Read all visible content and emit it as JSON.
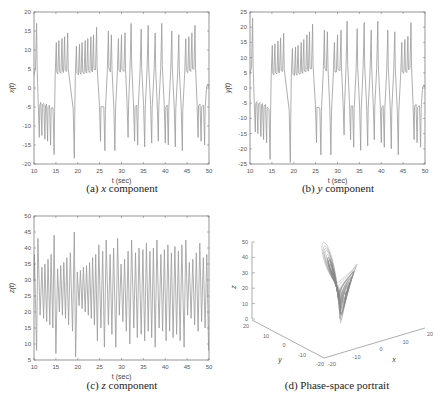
{
  "chart_data": [
    {
      "id": "a",
      "type": "line",
      "caption": "(a) x component",
      "caption_prefix": "(a)",
      "caption_var": "x",
      "caption_suffix": "component",
      "xlabel": "t (sec)",
      "ylabel": "x(t)",
      "xlim": [
        10,
        50
      ],
      "ylim": [
        -20,
        20
      ],
      "xticks": [
        10,
        15,
        20,
        25,
        30,
        35,
        40,
        45,
        50
      ],
      "yticks": [
        -20,
        -15,
        -10,
        -5,
        0,
        5,
        10,
        15,
        20
      ],
      "grid": false,
      "color": "#9a9a9a",
      "peaks": [
        {
          "t": 10.6,
          "v": 17
        },
        {
          "t": 11.2,
          "v": -13
        },
        {
          "t": 11.8,
          "v": -12.5
        },
        {
          "t": 12.5,
          "v": -13.5
        },
        {
          "t": 13.1,
          "v": -14
        },
        {
          "t": 13.8,
          "v": -15
        },
        {
          "t": 14.6,
          "v": -17.5
        },
        {
          "t": 15.1,
          "v": 12
        },
        {
          "t": 15.7,
          "v": 12.5
        },
        {
          "t": 16.4,
          "v": 13
        },
        {
          "t": 17.0,
          "v": 13.5
        },
        {
          "t": 17.7,
          "v": 14.5
        },
        {
          "t": 19.2,
          "v": -18.5
        },
        {
          "t": 19.7,
          "v": 11
        },
        {
          "t": 20.4,
          "v": 11.5
        },
        {
          "t": 21.0,
          "v": 12
        },
        {
          "t": 21.7,
          "v": 12.5
        },
        {
          "t": 22.3,
          "v": 13
        },
        {
          "t": 23.0,
          "v": 13.5
        },
        {
          "t": 23.6,
          "v": 14
        },
        {
          "t": 24.3,
          "v": 16
        },
        {
          "t": 25.2,
          "v": -14
        },
        {
          "t": 26.2,
          "v": -16.5
        },
        {
          "t": 27.0,
          "v": 15
        },
        {
          "t": 27.7,
          "v": 14
        },
        {
          "t": 28.5,
          "v": -16.5
        },
        {
          "t": 29.3,
          "v": 13
        },
        {
          "t": 30.0,
          "v": 14
        },
        {
          "t": 30.8,
          "v": 14.5
        },
        {
          "t": 31.5,
          "v": -13
        },
        {
          "t": 32.2,
          "v": 17
        },
        {
          "t": 33.0,
          "v": -14
        },
        {
          "t": 33.7,
          "v": -15
        },
        {
          "t": 34.5,
          "v": 15.5
        },
        {
          "t": 35.3,
          "v": -15.5
        },
        {
          "t": 36.1,
          "v": 16.5
        },
        {
          "t": 36.9,
          "v": -14.5
        },
        {
          "t": 37.7,
          "v": 14.5
        },
        {
          "t": 38.4,
          "v": -14
        },
        {
          "t": 39.2,
          "v": 17
        },
        {
          "t": 40.0,
          "v": -14.5
        },
        {
          "t": 40.7,
          "v": -15
        },
        {
          "t": 41.5,
          "v": 15
        },
        {
          "t": 42.3,
          "v": -15.5
        },
        {
          "t": 43.1,
          "v": 14
        },
        {
          "t": 43.9,
          "v": -16.5
        },
        {
          "t": 44.7,
          "v": 13
        },
        {
          "t": 45.4,
          "v": 13.5
        },
        {
          "t": 46.1,
          "v": 14.5
        },
        {
          "t": 46.8,
          "v": 16.5
        },
        {
          "t": 47.5,
          "v": -13
        },
        {
          "t": 48.2,
          "v": -14
        },
        {
          "t": 49.0,
          "v": -15
        },
        {
          "t": 49.7,
          "v": 1
        }
      ]
    },
    {
      "id": "b",
      "type": "line",
      "caption": "(b) y component",
      "caption_prefix": "(b)",
      "caption_var": "y",
      "caption_suffix": "component",
      "xlabel": "t (sec)",
      "ylabel": "y(t)",
      "xlim": [
        10,
        50
      ],
      "ylim": [
        -25,
        25
      ],
      "xticks": [
        10,
        15,
        20,
        25,
        30,
        35,
        40,
        45,
        50
      ],
      "yticks": [
        -25,
        -20,
        -15,
        -10,
        -5,
        0,
        5,
        10,
        15,
        20,
        25
      ],
      "grid": false,
      "color": "#9a9a9a",
      "peaks": [
        {
          "t": 10.6,
          "v": 23
        },
        {
          "t": 11.2,
          "v": -14.5
        },
        {
          "t": 11.8,
          "v": -15
        },
        {
          "t": 12.5,
          "v": -16
        },
        {
          "t": 13.1,
          "v": -17
        },
        {
          "t": 13.8,
          "v": -18
        },
        {
          "t": 14.6,
          "v": -23.5
        },
        {
          "t": 15.1,
          "v": 14
        },
        {
          "t": 15.7,
          "v": 14.5
        },
        {
          "t": 16.4,
          "v": 15.5
        },
        {
          "t": 17.0,
          "v": 16.5
        },
        {
          "t": 17.7,
          "v": 18
        },
        {
          "t": 19.2,
          "v": -24.5
        },
        {
          "t": 19.7,
          "v": 13
        },
        {
          "t": 20.4,
          "v": 13.5
        },
        {
          "t": 21.0,
          "v": 14
        },
        {
          "t": 21.7,
          "v": 15
        },
        {
          "t": 22.3,
          "v": 16
        },
        {
          "t": 23.0,
          "v": 17.5
        },
        {
          "t": 23.6,
          "v": 18.5
        },
        {
          "t": 24.3,
          "v": 21
        },
        {
          "t": 25.2,
          "v": -18
        },
        {
          "t": 26.2,
          "v": -22
        },
        {
          "t": 27.0,
          "v": 19
        },
        {
          "t": 27.7,
          "v": 18.5
        },
        {
          "t": 28.5,
          "v": -22
        },
        {
          "t": 29.3,
          "v": 15
        },
        {
          "t": 30.0,
          "v": 17.5
        },
        {
          "t": 30.8,
          "v": 19
        },
        {
          "t": 31.5,
          "v": -15.5
        },
        {
          "t": 32.2,
          "v": 22
        },
        {
          "t": 33.0,
          "v": -17
        },
        {
          "t": 33.7,
          "v": -19.5
        },
        {
          "t": 34.5,
          "v": 19.5
        },
        {
          "t": 35.3,
          "v": -20.5
        },
        {
          "t": 36.1,
          "v": 21.5
        },
        {
          "t": 36.9,
          "v": -19
        },
        {
          "t": 37.7,
          "v": 19
        },
        {
          "t": 38.4,
          "v": -17
        },
        {
          "t": 39.2,
          "v": 22
        },
        {
          "t": 40.0,
          "v": -18
        },
        {
          "t": 40.7,
          "v": -19.5
        },
        {
          "t": 41.5,
          "v": 19
        },
        {
          "t": 42.3,
          "v": -20
        },
        {
          "t": 43.1,
          "v": 18.5
        },
        {
          "t": 43.9,
          "v": -22
        },
        {
          "t": 44.7,
          "v": 15
        },
        {
          "t": 45.4,
          "v": 16
        },
        {
          "t": 46.1,
          "v": 17
        },
        {
          "t": 46.8,
          "v": 21.5
        },
        {
          "t": 47.5,
          "v": -17
        },
        {
          "t": 48.2,
          "v": -18
        },
        {
          "t": 49.0,
          "v": -19.5
        },
        {
          "t": 49.7,
          "v": 1
        }
      ]
    },
    {
      "id": "c",
      "type": "line",
      "caption": "(c) z component",
      "caption_prefix": "(c)",
      "caption_var": "z",
      "caption_suffix": "component",
      "xlabel": "t (sec)",
      "ylabel": "z(t)",
      "xlim": [
        10,
        50
      ],
      "ylim": [
        5,
        50
      ],
      "xticks": [
        10,
        15,
        20,
        25,
        30,
        35,
        40,
        45,
        50
      ],
      "yticks": [
        5,
        10,
        15,
        20,
        25,
        30,
        35,
        40,
        45,
        50
      ],
      "grid": false,
      "color": "#9a9a9a",
      "peaks": [
        {
          "t": 10.1,
          "v": 38
        },
        {
          "t": 10.6,
          "v": 8
        },
        {
          "t": 10.9,
          "v": 43
        },
        {
          "t": 11.4,
          "v": 19
        },
        {
          "t": 11.8,
          "v": 34
        },
        {
          "t": 12.2,
          "v": 18
        },
        {
          "t": 12.5,
          "v": 35
        },
        {
          "t": 12.9,
          "v": 17
        },
        {
          "t": 13.2,
          "v": 36.5
        },
        {
          "t": 13.6,
          "v": 16
        },
        {
          "t": 13.9,
          "v": 38
        },
        {
          "t": 14.3,
          "v": 15
        },
        {
          "t": 14.6,
          "v": 44
        },
        {
          "t": 15.0,
          "v": 7
        },
        {
          "t": 15.4,
          "v": 33.5
        },
        {
          "t": 15.8,
          "v": 20
        },
        {
          "t": 16.1,
          "v": 34.5
        },
        {
          "t": 16.5,
          "v": 19
        },
        {
          "t": 16.8,
          "v": 35.5
        },
        {
          "t": 17.2,
          "v": 18
        },
        {
          "t": 17.5,
          "v": 37
        },
        {
          "t": 17.9,
          "v": 16
        },
        {
          "t": 18.3,
          "v": 38.5
        },
        {
          "t": 18.8,
          "v": 14
        },
        {
          "t": 19.2,
          "v": 45
        },
        {
          "t": 19.5,
          "v": 6
        },
        {
          "t": 19.9,
          "v": 32.5
        },
        {
          "t": 20.3,
          "v": 22
        },
        {
          "t": 20.6,
          "v": 33
        },
        {
          "t": 21.0,
          "v": 21
        },
        {
          "t": 21.3,
          "v": 34
        },
        {
          "t": 21.7,
          "v": 20
        },
        {
          "t": 22.0,
          "v": 34.5
        },
        {
          "t": 22.4,
          "v": 19
        },
        {
          "t": 22.7,
          "v": 35.5
        },
        {
          "t": 23.1,
          "v": 18
        },
        {
          "t": 23.4,
          "v": 37
        },
        {
          "t": 23.8,
          "v": 16
        },
        {
          "t": 24.1,
          "v": 38
        },
        {
          "t": 24.5,
          "v": 11
        },
        {
          "t": 24.8,
          "v": 41
        },
        {
          "t": 25.3,
          "v": 15
        },
        {
          "t": 25.7,
          "v": 39
        },
        {
          "t": 26.1,
          "v": 9
        },
        {
          "t": 26.5,
          "v": 42.5
        },
        {
          "t": 27.0,
          "v": 16
        },
        {
          "t": 27.4,
          "v": 38
        },
        {
          "t": 27.8,
          "v": 13
        },
        {
          "t": 28.2,
          "v": 40
        },
        {
          "t": 28.7,
          "v": 9
        },
        {
          "t": 29.1,
          "v": 43
        },
        {
          "t": 29.5,
          "v": 19
        },
        {
          "t": 29.9,
          "v": 35
        },
        {
          "t": 30.3,
          "v": 17
        },
        {
          "t": 30.7,
          "v": 36.5
        },
        {
          "t": 31.1,
          "v": 14
        },
        {
          "t": 31.5,
          "v": 39
        },
        {
          "t": 31.9,
          "v": 10
        },
        {
          "t": 32.3,
          "v": 42.5
        },
        {
          "t": 32.8,
          "v": 15
        },
        {
          "t": 33.2,
          "v": 38.5
        },
        {
          "t": 33.6,
          "v": 12
        },
        {
          "t": 34.0,
          "v": 40
        },
        {
          "t": 34.5,
          "v": 13
        },
        {
          "t": 34.9,
          "v": 39.5
        },
        {
          "t": 35.3,
          "v": 11
        },
        {
          "t": 35.7,
          "v": 41.5
        },
        {
          "t": 36.1,
          "v": 14
        },
        {
          "t": 36.5,
          "v": 39
        },
        {
          "t": 36.9,
          "v": 12
        },
        {
          "t": 37.3,
          "v": 40
        },
        {
          "t": 37.7,
          "v": 9
        },
        {
          "t": 38.1,
          "v": 42.5
        },
        {
          "t": 38.6,
          "v": 15
        },
        {
          "t": 39.0,
          "v": 38
        },
        {
          "t": 39.4,
          "v": 14
        },
        {
          "t": 39.8,
          "v": 39.5
        },
        {
          "t": 40.2,
          "v": 11
        },
        {
          "t": 40.6,
          "v": 41
        },
        {
          "t": 41.0,
          "v": 14
        },
        {
          "t": 41.4,
          "v": 38.5
        },
        {
          "t": 41.8,
          "v": 12
        },
        {
          "t": 42.2,
          "v": 40.5
        },
        {
          "t": 42.6,
          "v": 13
        },
        {
          "t": 43.0,
          "v": 39
        },
        {
          "t": 43.4,
          "v": 11
        },
        {
          "t": 43.8,
          "v": 41
        },
        {
          "t": 44.3,
          "v": 9
        },
        {
          "t": 44.7,
          "v": 42.5
        },
        {
          "t": 45.1,
          "v": 19
        },
        {
          "t": 45.5,
          "v": 35.5
        },
        {
          "t": 45.9,
          "v": 18
        },
        {
          "t": 46.3,
          "v": 36.5
        },
        {
          "t": 46.7,
          "v": 16
        },
        {
          "t": 47.1,
          "v": 38.5
        },
        {
          "t": 47.5,
          "v": 14
        },
        {
          "t": 47.9,
          "v": 41.5
        },
        {
          "t": 48.3,
          "v": 17
        },
        {
          "t": 48.7,
          "v": 37
        },
        {
          "t": 49.1,
          "v": 15
        },
        {
          "t": 49.5,
          "v": 38
        },
        {
          "t": 49.9,
          "v": 8
        }
      ]
    },
    {
      "id": "d",
      "type": "line3d",
      "caption": "(d) Phase-space portrait",
      "xlabel": "x",
      "ylabel": "y",
      "zlabel": "z",
      "xlim": [
        -20,
        20
      ],
      "ylim": [
        -20,
        20
      ],
      "zlim": [
        0,
        50
      ],
      "xticks": [
        -20,
        -10,
        0,
        10,
        20
      ],
      "yticks": [
        -20,
        -10,
        0,
        10,
        20
      ],
      "zticks": [
        0,
        10,
        20,
        30,
        40,
        50
      ],
      "grid": false,
      "color": "#8a8a8a",
      "description": "Lorenz-type butterfly attractor: two lobes, a larger upper-right lobe reaching z≈48 and a smaller left lobe extending toward x≈-20, joined at a tail near z≈5."
    }
  ]
}
